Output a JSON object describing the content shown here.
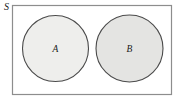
{
  "diagram": {
    "type": "venn-diagram",
    "universe": {
      "label": "S",
      "shape": "rectangle",
      "x": 12.5,
      "y": 5.5,
      "width": 159,
      "height": 89,
      "fill_color": "#ffffff",
      "stroke_color": "#8d8d8d",
      "stroke_width": 1.2,
      "label_x": 6.5,
      "label_y": 7.5
    },
    "sets": [
      {
        "label": "A",
        "shape": "circle",
        "cx": 55.5,
        "cy": 48.5,
        "r": 33,
        "fill_color": "#eeeeec",
        "stroke_color": "#4a4a4a",
        "stroke_width": 1.1,
        "label_x": 55.5,
        "label_y": 49.5
      },
      {
        "label": "B",
        "shape": "circle",
        "cx": 129.5,
        "cy": 48.5,
        "r": 33.5,
        "fill_color": "#e4e4e2",
        "stroke_color": "#4a4a4a",
        "stroke_width": 1.1,
        "label_x": 129.5,
        "label_y": 49.5
      }
    ],
    "relationship": "disjoint",
    "background_color": "#ffffff"
  }
}
